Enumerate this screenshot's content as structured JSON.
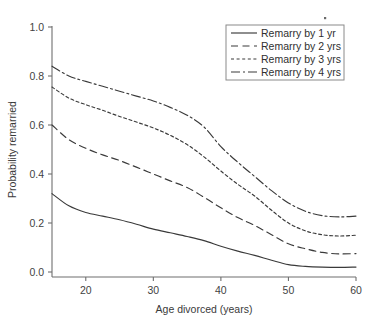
{
  "chart_data": {
    "type": "line",
    "title": "",
    "xlabel": "Age divorced (years)",
    "ylabel": "Probability remarried",
    "xlim": [
      15,
      60
    ],
    "ylim": [
      0.0,
      1.0
    ],
    "grid": false,
    "legend_position": "top-right",
    "xticks": [
      20,
      30,
      40,
      50,
      60
    ],
    "xtick_labels": [
      "20",
      "30",
      "40",
      "50",
      "60"
    ],
    "yticks": [
      0.0,
      0.2,
      0.4,
      0.6,
      0.8,
      1.0
    ],
    "ytick_labels": [
      "0.0",
      "0.2",
      "0.4",
      "0.6",
      "0.8",
      "1.0"
    ],
    "x": [
      15,
      17.5,
      20,
      22.5,
      25,
      27.5,
      30,
      32.5,
      35,
      37.5,
      40,
      42.5,
      45,
      47.5,
      50,
      52.5,
      55,
      57.5,
      60
    ],
    "series": [
      {
        "name": "Remarry by 1 yr",
        "dash": "solid",
        "values": [
          0.32,
          0.27,
          0.243,
          0.228,
          0.213,
          0.195,
          0.175,
          0.16,
          0.145,
          0.128,
          0.105,
          0.085,
          0.068,
          0.048,
          0.03,
          0.023,
          0.02,
          0.019,
          0.02
        ]
      },
      {
        "name": "Remarry by 2 yrs",
        "dash": "dashed",
        "values": [
          0.6,
          0.54,
          0.505,
          0.478,
          0.455,
          0.428,
          0.4,
          0.372,
          0.345,
          0.305,
          0.262,
          0.222,
          0.19,
          0.152,
          0.115,
          0.095,
          0.08,
          0.074,
          0.075
        ]
      },
      {
        "name": "Remarry by 3 yrs",
        "dash": "dotted",
        "values": [
          0.755,
          0.71,
          0.683,
          0.66,
          0.635,
          0.612,
          0.588,
          0.558,
          0.52,
          0.47,
          0.412,
          0.358,
          0.31,
          0.252,
          0.2,
          0.168,
          0.152,
          0.147,
          0.15
        ]
      },
      {
        "name": "Remarry by 4 yrs",
        "dash": "dashdot",
        "values": [
          0.84,
          0.8,
          0.778,
          0.758,
          0.738,
          0.718,
          0.698,
          0.672,
          0.64,
          0.592,
          0.512,
          0.448,
          0.39,
          0.332,
          0.282,
          0.248,
          0.23,
          0.225,
          0.228
        ]
      }
    ]
  },
  "legend": {
    "items": [
      {
        "label": "Remarry by 1 yr"
      },
      {
        "label": "Remarry by 2 yrs"
      },
      {
        "label": "Remarry by 3 yrs"
      },
      {
        "label": "Remarry by 4 yrs"
      }
    ]
  },
  "colors": {
    "line": "#3a3a3a",
    "axis": "#6f6f6f",
    "text": "#3a3a3a",
    "background": "#ffffff"
  }
}
